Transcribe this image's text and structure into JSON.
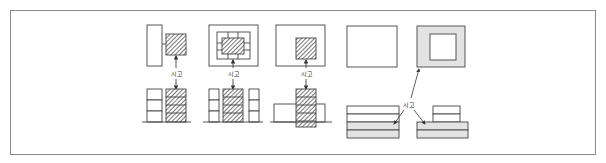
{
  "figure": {
    "label_text": "시고",
    "colors": {
      "frame": "#8a8a8a",
      "stroke": "#444444",
      "gray_fill": "#e3e3e3",
      "hatch": "#555555"
    }
  },
  "diagrams": [
    {
      "id": "d1",
      "label": "시고"
    },
    {
      "id": "d2",
      "label": "시고"
    },
    {
      "id": "d3",
      "label": "시고"
    },
    {
      "id": "d45",
      "label": "시고"
    }
  ]
}
